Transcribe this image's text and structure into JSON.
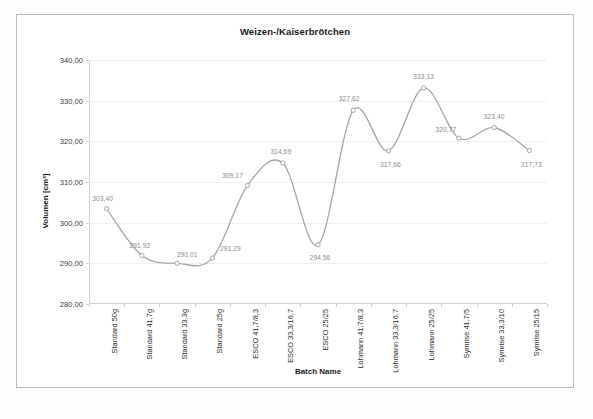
{
  "chart_data": {
    "type": "line",
    "title": "Weizen-/Kaiserbrötchen",
    "xlabel": "Batch Name",
    "ylabel": "Volumen [cm³]",
    "ylim": [
      280.0,
      340.0
    ],
    "ytick_step": 10.0,
    "ytick_labels": [
      "280,00",
      "290,00",
      "300,00",
      "310,00",
      "320,00",
      "330,00",
      "340,00"
    ],
    "ytick_values": [
      280.0,
      290.0,
      300.0,
      310.0,
      320.0,
      330.0,
      340.0
    ],
    "grid": true,
    "legend": "none",
    "smoothing": "spline",
    "marker": "open-circle",
    "line_color": "#a6a6a6",
    "label_color": "#8a8a8a",
    "categories": [
      "Standard 50g",
      "Standard 41,7g",
      "Standard 33,3g",
      "Standard 25g",
      "ESCO 41,7/8,3",
      "ESCO 33,3/16,7",
      "ESCO 25/25",
      "Lohmann 41,7/8,3",
      "Lohmann 33,3/16,7",
      "Lohmann 25/25",
      "Symrise 41,7/5",
      "Symrise 33,3/10",
      "Symrise 25/15"
    ],
    "values": [
      303.4,
      291.92,
      290.01,
      291.29,
      309.17,
      314.69,
      294.56,
      327.62,
      317.66,
      333.13,
      320.77,
      323.4,
      317.73
    ],
    "data_labels": [
      "303,40",
      "291,92",
      "290,01",
      "291,29",
      "309,17",
      "314,69",
      "294,56",
      "327,62",
      "317,66",
      "333,13",
      "320,77",
      "323,40",
      "317,73"
    ]
  }
}
